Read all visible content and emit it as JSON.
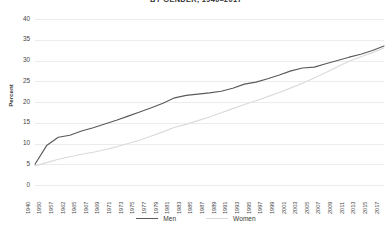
{
  "chart_data": {
    "type": "line",
    "title": "BY GENDER, 1940–2017",
    "xlabel": "",
    "ylabel": "Percent",
    "ylim": [
      0,
      40
    ],
    "yticks": [
      0,
      5,
      10,
      15,
      20,
      25,
      30,
      35,
      40
    ],
    "grid": true,
    "legend_position": "bottom-center",
    "colors": {
      "men": "#5a5a5a",
      "women": "#dadada",
      "grid": "#ececec",
      "text": "#3a3a3a"
    },
    "xticks": [
      "1940",
      "1950",
      "1957",
      "1962",
      "1965",
      "1967",
      "1969",
      "1971",
      "1973",
      "1975",
      "1977",
      "1979",
      "1981",
      "1983",
      "1985",
      "1987",
      "1989",
      "1991",
      "1993",
      "1995",
      "1997",
      "1999",
      "2001",
      "2003",
      "2005",
      "2007",
      "2009",
      "2011",
      "2013",
      "2015",
      "2017"
    ],
    "x": [
      1940,
      1950,
      1957,
      1962,
      1965,
      1967,
      1969,
      1971,
      1973,
      1975,
      1977,
      1979,
      1981,
      1983,
      1985,
      1987,
      1989,
      1991,
      1993,
      1995,
      1997,
      1999,
      2001,
      2003,
      2005,
      2007,
      2009,
      2011,
      2013,
      2015,
      2017
    ],
    "series": [
      {
        "name": "Men",
        "color": "#5a5a5a",
        "values": [
          5.0,
          9.5,
          11.5,
          12.0,
          13.0,
          13.8,
          14.7,
          15.6,
          16.6,
          17.6,
          18.6,
          19.7,
          21.0,
          21.6,
          21.9,
          22.2,
          22.6,
          23.3,
          24.3,
          24.8,
          25.6,
          26.5,
          27.5,
          28.2,
          28.4,
          29.2,
          30.0,
          30.8,
          31.5,
          32.4,
          33.5
        ]
      },
      {
        "name": "Women",
        "color": "#dadada",
        "values": [
          4.6,
          5.4,
          6.2,
          6.8,
          7.4,
          7.9,
          8.5,
          9.2,
          10.0,
          10.8,
          11.8,
          12.8,
          13.9,
          14.6,
          15.5,
          16.4,
          17.4,
          18.4,
          19.4,
          20.3,
          21.3,
          22.3,
          23.4,
          24.5,
          25.8,
          27.1,
          28.5,
          29.8,
          30.9,
          31.9,
          33.0
        ]
      }
    ]
  },
  "axis": {
    "ylabel": "Percent"
  },
  "legend": {
    "items": [
      {
        "label": "Men"
      },
      {
        "label": "Women"
      }
    ]
  }
}
